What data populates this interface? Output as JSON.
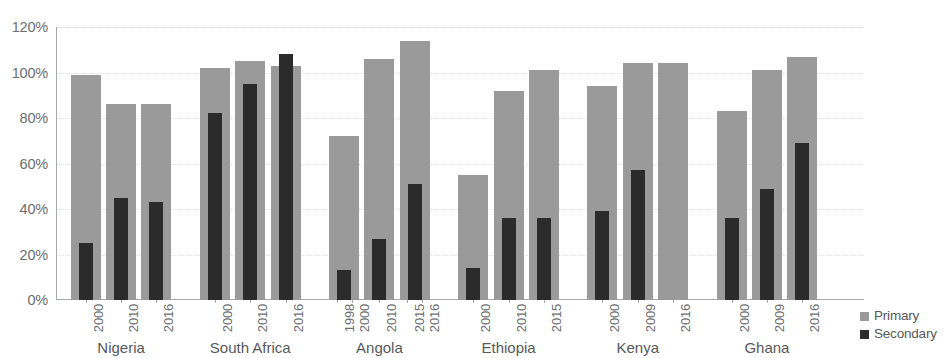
{
  "chart_data": {
    "type": "bar",
    "title": "",
    "xlabel": "",
    "ylabel": "",
    "ylim": [
      0,
      120
    ],
    "y_tick_labels": [
      "0%",
      "20%",
      "40%",
      "60%",
      "80%",
      "100%",
      "120%"
    ],
    "y_tick_values": [
      0,
      20,
      40,
      60,
      80,
      100,
      120
    ],
    "grid": true,
    "grid_axis": "y",
    "legend_position": "bottom-right",
    "legend": [
      "Primary",
      "Secondary"
    ],
    "series": [
      {
        "name": "Primary",
        "color": "#9a9a9a",
        "values": [
          99,
          86,
          86,
          102,
          105,
          103,
          72,
          106,
          114,
          55,
          92,
          101,
          94,
          104,
          104,
          83,
          101,
          107
        ]
      },
      {
        "name": "Secondary",
        "color": "#2b2b2b",
        "values": [
          25,
          45,
          43,
          82,
          95,
          108,
          13,
          27,
          51,
          14,
          36,
          36,
          39,
          57,
          null,
          36,
          49,
          69
        ]
      }
    ],
    "groups": [
      {
        "label": "Nigeria",
        "bars": [
          {
            "year_labels": [
              "2000"
            ],
            "primary": 99,
            "secondary": 25
          },
          {
            "year_labels": [
              "2010"
            ],
            "primary": 86,
            "secondary": 45
          },
          {
            "year_labels": [
              "2016"
            ],
            "primary": 86,
            "secondary": 43
          }
        ]
      },
      {
        "label": "South Africa",
        "bars": [
          {
            "year_labels": [
              "2000"
            ],
            "primary": 102,
            "secondary": 82
          },
          {
            "year_labels": [
              "2010"
            ],
            "primary": 105,
            "secondary": 95
          },
          {
            "year_labels": [
              "2016"
            ],
            "primary": 103,
            "secondary": 108
          }
        ]
      },
      {
        "label": "Angola",
        "bars": [
          {
            "year_labels": [
              "1998",
              "2000"
            ],
            "primary": 72,
            "secondary": 13
          },
          {
            "year_labels": [
              "2010"
            ],
            "primary": 106,
            "secondary": 27
          },
          {
            "year_labels": [
              "2015",
              "2016"
            ],
            "primary": 114,
            "secondary": 51
          }
        ]
      },
      {
        "label": "Ethiopia",
        "bars": [
          {
            "year_labels": [
              "2000"
            ],
            "primary": 55,
            "secondary": 14
          },
          {
            "year_labels": [
              "2010"
            ],
            "primary": 92,
            "secondary": 36
          },
          {
            "year_labels": [
              "2015"
            ],
            "primary": 101,
            "secondary": 36
          }
        ]
      },
      {
        "label": "Kenya",
        "bars": [
          {
            "year_labels": [
              "2000"
            ],
            "primary": 94,
            "secondary": 39
          },
          {
            "year_labels": [
              "2009"
            ],
            "primary": 104,
            "secondary": 57
          },
          {
            "year_labels": [
              "2016"
            ],
            "primary": 104,
            "secondary": null
          }
        ]
      },
      {
        "label": "Ghana",
        "bars": [
          {
            "year_labels": [
              "2000"
            ],
            "primary": 83,
            "secondary": 36
          },
          {
            "year_labels": [
              "2009"
            ],
            "primary": 101,
            "secondary": 49
          },
          {
            "year_labels": [
              "2016"
            ],
            "primary": 107,
            "secondary": 69
          }
        ]
      }
    ]
  },
  "legend": {
    "primary_label": "Primary",
    "secondary_label": "Secondary"
  },
  "colors": {
    "primary": "#9a9a9a",
    "secondary": "#2b2b2b",
    "axis": "#a7a9ac",
    "gridline": "#e3e0e8",
    "label_text": "#6d6e71"
  }
}
